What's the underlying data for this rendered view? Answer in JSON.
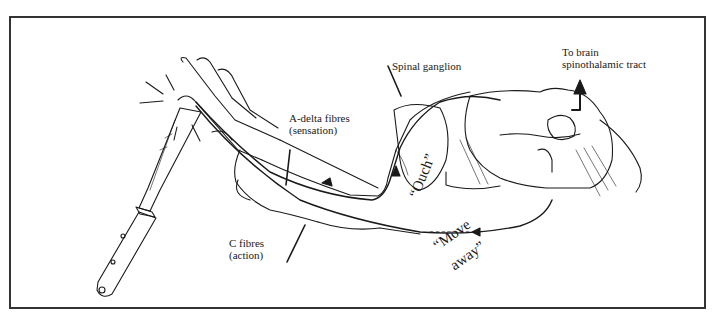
{
  "figure": {
    "frame_color": "#333333",
    "ink_color": "#1a1a1a"
  },
  "labels": {
    "a_delta": {
      "line1": "A-delta fibres",
      "line2": "(sensation)"
    },
    "spinal_ganglion": {
      "text": "Spinal ganglion"
    },
    "to_brain": {
      "line1": "To brain",
      "line2": "spinothalamic tract"
    },
    "c_fibres": {
      "line1": "C fibres",
      "line2": "(action)"
    }
  },
  "quotes": {
    "ouch": "“Ouch”",
    "move": "“Move",
    "away": "away”"
  },
  "illustration": {
    "objects": [
      "knife-blade",
      "knife-handle",
      "hand",
      "forearm",
      "spinal-ganglion",
      "spinal-cord-section",
      "ascending-arrow"
    ],
    "pain_marks": "radiating lines at fingertip"
  }
}
